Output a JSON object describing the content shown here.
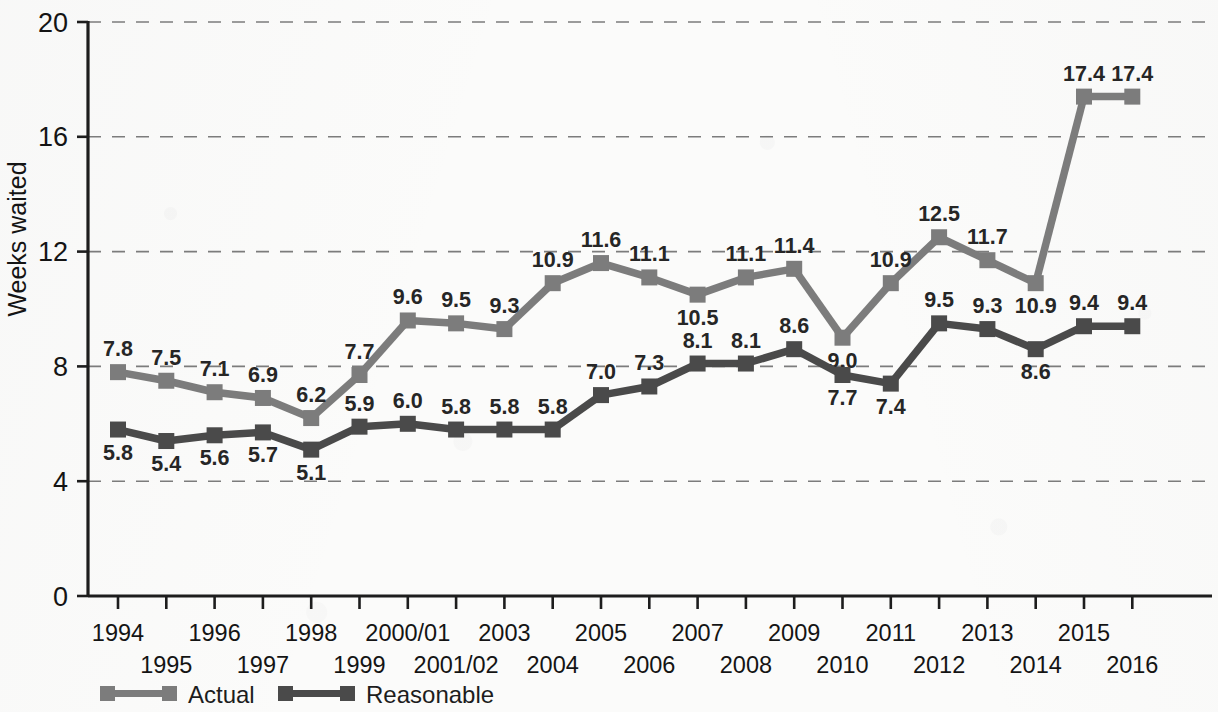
{
  "chart_data": {
    "type": "line",
    "title": "",
    "xlabel": "",
    "ylabel": "Weeks waited",
    "ylim": [
      0,
      20
    ],
    "yticks": [
      0,
      4,
      8,
      12,
      16,
      20
    ],
    "ytick_labels": [
      "0",
      "4",
      "8",
      "12",
      "16",
      "20"
    ],
    "grid": "horizontal-dashed",
    "legend_position": "bottom-left",
    "categories": [
      "1994",
      "1995",
      "1996",
      "1997",
      "1998",
      "1999",
      "2000/01",
      "2001/02",
      "2003",
      "2004",
      "2005",
      "2006",
      "2007",
      "2008",
      "2009",
      "2010",
      "2011",
      "2012",
      "2013",
      "2014",
      "2015",
      "2016"
    ],
    "series": [
      {
        "name": "Actual",
        "color": "#7c7c7c",
        "values": [
          7.8,
          7.5,
          7.1,
          6.9,
          6.2,
          7.7,
          9.6,
          9.5,
          9.3,
          10.9,
          11.6,
          11.1,
          10.5,
          11.1,
          11.4,
          9.0,
          10.9,
          12.5,
          11.7,
          10.9,
          17.4,
          17.4
        ],
        "labels": [
          "7.8",
          "7.5",
          "7.1",
          "6.9",
          "6.2",
          "7.7",
          "9.6",
          "9.5",
          "9.3",
          "10.9",
          "11.6",
          "11.1",
          "10.5",
          "11.1",
          "11.4",
          "9.0",
          "10.9",
          "12.5",
          "11.7",
          "10.9",
          "17.4",
          "17.4"
        ]
      },
      {
        "name": "Reasonable",
        "color": "#4a4a4a",
        "values": [
          5.8,
          5.4,
          5.6,
          5.7,
          5.1,
          5.9,
          6.0,
          5.8,
          5.8,
          5.8,
          7.0,
          7.3,
          8.1,
          8.1,
          8.6,
          7.7,
          7.4,
          9.5,
          9.3,
          8.6,
          9.4,
          9.4
        ],
        "labels": [
          "5.8",
          "5.4",
          "5.6",
          "5.7",
          "5.1",
          "5.9",
          "6.0",
          "5.8",
          "5.8",
          "5.8",
          "7.0",
          "7.3",
          "8.1",
          "8.1",
          "8.6",
          "7.7",
          "7.4",
          "9.5",
          "9.3",
          "8.6",
          "9.4",
          "9.4"
        ]
      }
    ],
    "xtick_rows": {
      "top": [
        "1994",
        "1996",
        "1998",
        "2000/01",
        "2003",
        "2005",
        "2007",
        "2009",
        "2011",
        "2013",
        "2015"
      ],
      "bottom": [
        "1995",
        "1997",
        "1999",
        "2001/02",
        "2004",
        "2006",
        "2008",
        "2010",
        "2012",
        "2014",
        "2016"
      ]
    },
    "label_positions_actual": [
      "above",
      "above",
      "above",
      "above",
      "above",
      "above",
      "above",
      "above",
      "above",
      "above",
      "above",
      "above",
      "below",
      "above",
      "above",
      "below",
      "above",
      "above",
      "above",
      "below",
      "above",
      "above"
    ],
    "label_positions_reasonable": [
      "below",
      "below",
      "below",
      "below",
      "below",
      "above",
      "above",
      "above",
      "above",
      "above",
      "above",
      "above",
      "above",
      "above",
      "above",
      "below",
      "below",
      "above",
      "above",
      "below",
      "above",
      "above"
    ]
  },
  "legend": {
    "items": [
      {
        "name": "Actual",
        "label": "Actual",
        "color": "#7c7c7c"
      },
      {
        "name": "Reasonable",
        "label": "Reasonable",
        "color": "#4a4a4a"
      }
    ]
  }
}
